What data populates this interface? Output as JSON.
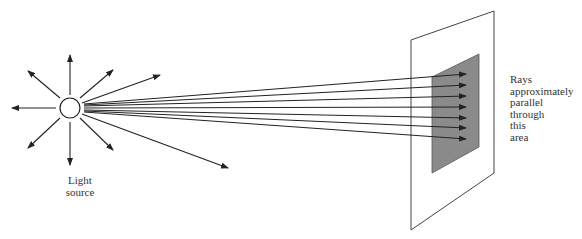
{
  "diagram": {
    "source_label": [
      "Light",
      "source"
    ],
    "region_label": [
      "Rays",
      "approximately",
      "parallel",
      "through",
      "this",
      "area"
    ],
    "colors": {
      "stroke": "#222222",
      "screen_fill": "#ffffff",
      "region_fill": "#8a8a8a"
    },
    "source": {
      "cx": 70,
      "cy": 108,
      "r": 10
    },
    "radial_arrows": 8,
    "converging_rays": 7
  }
}
